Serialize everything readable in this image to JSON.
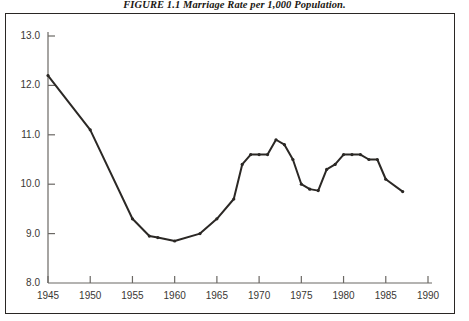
{
  "figure": {
    "title_prefix": "FIGURE 1.1",
    "title_text": "FIGURE 1.1  Marriage Rate per 1,000 Population.",
    "caption": "Marriage Rate per 1,000 Population."
  },
  "colors": {
    "line": "#2b2825",
    "axis": "#6b6864",
    "frame": "#2a2724",
    "text": "#3a3734",
    "background": "#ffffff"
  },
  "chart_data": {
    "type": "line",
    "title": "FIGURE 1.1  Marriage Rate per 1,000 Population.",
    "xlabel": "",
    "ylabel": "",
    "xlim": [
      1945,
      1990
    ],
    "ylim": [
      8.0,
      13.0
    ],
    "grid": false,
    "legend": "none",
    "markers": true,
    "xticks": [
      1945,
      1950,
      1955,
      1960,
      1965,
      1970,
      1975,
      1980,
      1985,
      1990
    ],
    "xticklabels": [
      "1945",
      "1950",
      "1955",
      "1960",
      "1965",
      "1970",
      "1975",
      "1980",
      "1985",
      "1990"
    ],
    "yticks": [
      8.0,
      9.0,
      10.0,
      11.0,
      12.0,
      13.0
    ],
    "yticklabels": [
      "8.0",
      "9.0",
      "10.0",
      "11.0",
      "12.0",
      "13.0"
    ],
    "series": [
      {
        "name": "Marriage rate per 1,000 population",
        "x": [
          1945,
          1950,
          1955,
          1957,
          1958,
          1960,
          1963,
          1965,
          1967,
          1968,
          1969,
          1970,
          1971,
          1972,
          1973,
          1974,
          1975,
          1976,
          1977,
          1978,
          1979,
          1980,
          1981,
          1982,
          1983,
          1984,
          1985,
          1987
        ],
        "values": [
          12.2,
          11.1,
          9.3,
          8.95,
          8.92,
          8.85,
          9.0,
          9.3,
          9.7,
          10.4,
          10.6,
          10.6,
          10.6,
          10.9,
          10.8,
          10.5,
          10.0,
          9.9,
          9.87,
          10.3,
          10.4,
          10.6,
          10.6,
          10.6,
          10.5,
          10.5,
          10.1,
          9.85
        ]
      }
    ]
  }
}
